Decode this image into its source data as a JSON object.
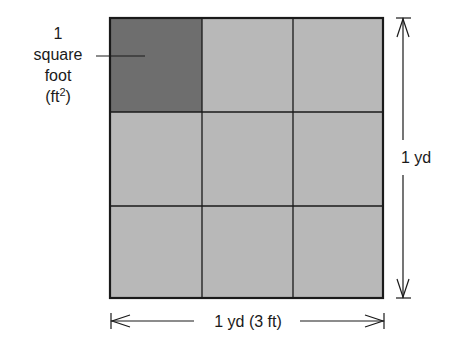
{
  "diagram": {
    "type": "area-unit-grid",
    "grid": {
      "rows": 3,
      "cols": 3,
      "highlighted_cell": {
        "row": 0,
        "col": 0
      },
      "colors": {
        "highlighted": "#6e6e6e",
        "normal": "#b8b8b8",
        "lines": "#1a1a1a"
      }
    },
    "callout": {
      "line1": "1",
      "line2": "square",
      "line3": "foot",
      "line4_prefix": "(ft",
      "line4_sup": "2",
      "line4_suffix": ")"
    },
    "dimensions": {
      "height_label": "1 yd",
      "width_label": "1 yd (3 ft)"
    }
  }
}
